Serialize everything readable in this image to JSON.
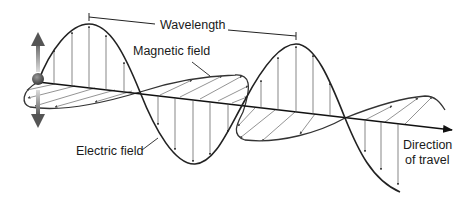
{
  "diagram": {
    "labels": {
      "wavelength": "Wavelength",
      "magnetic_field": "Magnetic field",
      "electric_field": "Electric field",
      "direction_line1": "Direction",
      "direction_line2": "of travel"
    },
    "elements": {
      "source_charge": "oscillating-charge",
      "oscillation_arrow": "double-headed vertical arrow",
      "axis": "propagation axis with arrowhead"
    },
    "colors": {
      "line": "#222222",
      "vector": "#555555",
      "charge": "#5a5a5a",
      "background": "#ffffff"
    }
  }
}
